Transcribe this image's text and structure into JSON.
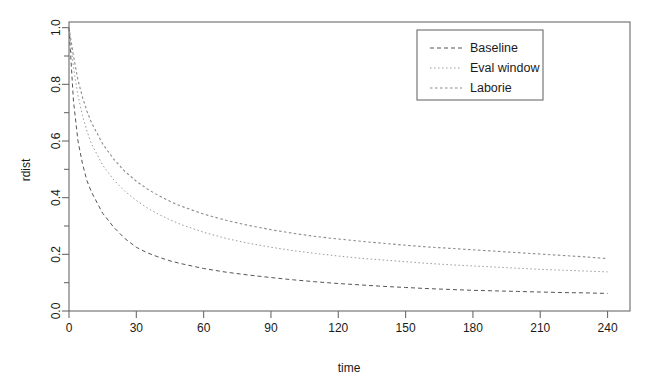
{
  "chart_data": {
    "type": "line",
    "title": "",
    "xlabel": "time",
    "ylabel": "rdist",
    "xlim": [
      0,
      250
    ],
    "ylim": [
      0.0,
      1.02
    ],
    "grid": false,
    "legend_position": "top-right",
    "x_ticks": [
      0,
      30,
      60,
      90,
      120,
      150,
      180,
      210,
      240
    ],
    "x_tick_labels": [
      "0",
      "30",
      "60",
      "90",
      "120",
      "150",
      "180",
      "210",
      "240"
    ],
    "y_ticks": [
      0.0,
      0.2,
      0.4,
      0.6,
      0.8,
      1.0
    ],
    "y_tick_labels": [
      "0.0",
      "0.2",
      "0.4",
      "0.6",
      "0.8",
      "1.0"
    ],
    "y_minor_ticks": [
      0.1,
      0.3,
      0.5,
      0.7,
      0.9
    ],
    "x": [
      0,
      2,
      4,
      6,
      8,
      10,
      15,
      20,
      25,
      30,
      35,
      40,
      45,
      50,
      60,
      70,
      80,
      90,
      100,
      110,
      120,
      130,
      140,
      150,
      160,
      170,
      180,
      190,
      200,
      210,
      220,
      230,
      240
    ],
    "series": [
      {
        "name": "Baseline",
        "color": "#555555",
        "dash": "4,3",
        "width": 1.0,
        "values": [
          1.0,
          0.74,
          0.6,
          0.52,
          0.46,
          0.42,
          0.345,
          0.295,
          0.255,
          0.225,
          0.205,
          0.19,
          0.177,
          0.167,
          0.15,
          0.137,
          0.127,
          0.118,
          0.11,
          0.103,
          0.097,
          0.092,
          0.087,
          0.083,
          0.079,
          0.076,
          0.073,
          0.071,
          0.069,
          0.067,
          0.065,
          0.064,
          0.062
        ]
      },
      {
        "name": "Eval window",
        "color": "#9a9a9a",
        "dash": "1.5,2.5",
        "width": 1.0,
        "values": [
          1.0,
          0.86,
          0.76,
          0.69,
          0.635,
          0.59,
          0.515,
          0.462,
          0.422,
          0.39,
          0.363,
          0.341,
          0.322,
          0.305,
          0.278,
          0.256,
          0.239,
          0.225,
          0.213,
          0.203,
          0.194,
          0.186,
          0.18,
          0.174,
          0.168,
          0.163,
          0.159,
          0.155,
          0.151,
          0.147,
          0.144,
          0.141,
          0.138
        ]
      },
      {
        "name": "Laborie",
        "color": "#8a8a8a",
        "dash": "2.5,2.5",
        "width": 1.1,
        "values": [
          1.0,
          0.9,
          0.815,
          0.755,
          0.705,
          0.665,
          0.59,
          0.535,
          0.492,
          0.458,
          0.43,
          0.407,
          0.387,
          0.37,
          0.342,
          0.32,
          0.302,
          0.287,
          0.274,
          0.263,
          0.254,
          0.246,
          0.239,
          0.232,
          0.226,
          0.221,
          0.216,
          0.211,
          0.206,
          0.201,
          0.196,
          0.191,
          0.185
        ]
      }
    ],
    "legend": {
      "entries": [
        "Baseline",
        "Eval window",
        "Laborie"
      ]
    }
  }
}
